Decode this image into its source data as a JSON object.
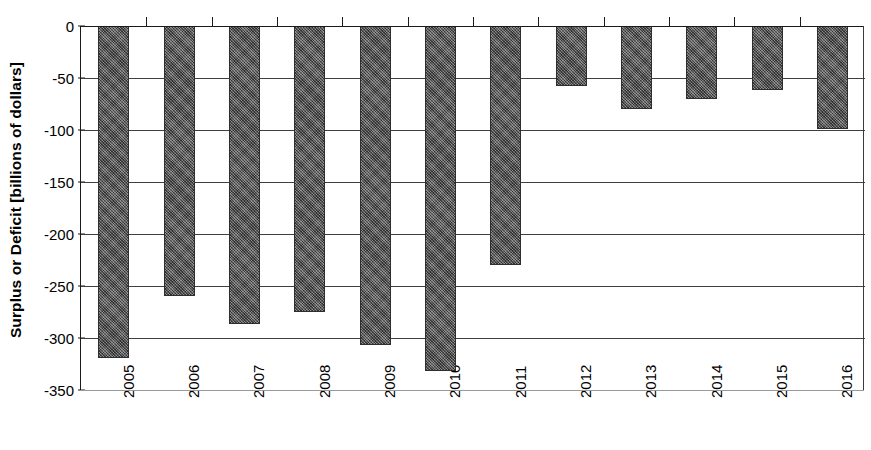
{
  "chart_data": {
    "type": "bar",
    "title": "",
    "xlabel": "",
    "ylabel": "Surplus or Deficit [billions of dollars]",
    "categories": [
      "2005",
      "2006",
      "2007",
      "2008",
      "2009",
      "2010",
      "2011",
      "2012",
      "2013",
      "2014",
      "2015",
      "2016"
    ],
    "values": [
      -319,
      -260,
      -287,
      -275,
      -307,
      -332,
      -230,
      -58,
      -80,
      -70,
      -62,
      -99
    ],
    "ylim": [
      -350,
      0
    ],
    "yticks": [
      0,
      -50,
      -100,
      -150,
      -200,
      -250,
      -300,
      -350
    ],
    "ytick_labels": [
      "0",
      "-50",
      "-100",
      "-150",
      "-200",
      "-250",
      "-300",
      "-350"
    ],
    "grid": true,
    "legend": null,
    "series": [
      {
        "name": "Surplus or Deficit",
        "values": [
          -319,
          -260,
          -287,
          -275,
          -307,
          -332,
          -230,
          -58,
          -80,
          -70,
          -62,
          -99
        ]
      }
    ],
    "bar_color": "#5a5a5a",
    "bar_edge_color": "#2e2e2e",
    "axis_color": "#1a1a1a",
    "grid_color": "#3f3f3f"
  },
  "axes": {
    "y_axis_title": "Surplus or Deficit [billions of dollars]"
  }
}
